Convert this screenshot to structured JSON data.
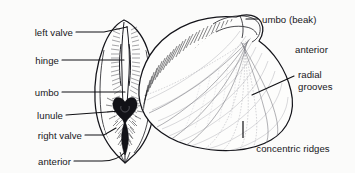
{
  "figure": {
    "background_color": "#fbfbfa",
    "ink_color": "#14141a",
    "views": [
      {
        "name": "anterior-view",
        "description": "anterior (front) view of closed clam showing both valves"
      },
      {
        "name": "lateral-view",
        "description": "lateral (side) view of single valve showing sculpture"
      }
    ]
  },
  "labels": {
    "left_valve": "left valve",
    "hinge": "hinge",
    "umbo": "umbo",
    "lunule": "lunule",
    "right_valve": "right valve",
    "anterior_left": "anterior",
    "umbo_beak": "umbo (beak)",
    "anterior_right": "anterior",
    "radial_line1": "radial",
    "radial_line2": "grooves",
    "concentric_ridges": "concentric ridges"
  }
}
